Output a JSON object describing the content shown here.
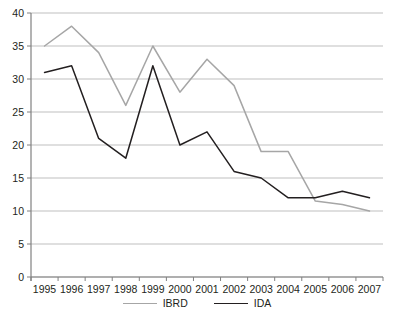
{
  "chart_data": {
    "type": "line",
    "title": "",
    "subtitle": "",
    "xlabel": "",
    "ylabel": "",
    "grid": true,
    "legend_position": "bottom",
    "categories": [
      "1995",
      "1996",
      "1997",
      "1998",
      "1999",
      "2000",
      "2001",
      "2002",
      "2003",
      "2004",
      "2005",
      "2006",
      "2007"
    ],
    "x": [
      1995,
      1996,
      1997,
      1998,
      1999,
      2000,
      2001,
      2002,
      2003,
      2004,
      2005,
      2006,
      2007
    ],
    "ylim": [
      0,
      40
    ],
    "yticks": [
      0,
      5,
      10,
      15,
      20,
      25,
      30,
      35,
      40
    ],
    "series": [
      {
        "name": "IBRD",
        "color": "#a6a6a6",
        "values": [
          35,
          38,
          34,
          26,
          35,
          28,
          33,
          29,
          19,
          19,
          11.5,
          11,
          10
        ]
      },
      {
        "name": "IDA",
        "color": "#231f20",
        "values": [
          31,
          32,
          21,
          18,
          32,
          20,
          22,
          16,
          15,
          12,
          12,
          13,
          12
        ]
      }
    ]
  },
  "axes": {
    "y_tick_labels": [
      "40",
      "35",
      "30",
      "25",
      "20",
      "15",
      "10",
      "5",
      "0"
    ],
    "x_tick_labels": [
      "1995",
      "1996",
      "1997",
      "1998",
      "1999",
      "2000",
      "2001",
      "2002",
      "2003",
      "2004",
      "2005",
      "2006",
      "2007"
    ]
  },
  "legend": {
    "items": [
      {
        "label": "IBRD",
        "color": "#a6a6a6"
      },
      {
        "label": "IDA",
        "color": "#231f20"
      }
    ]
  },
  "colors": {
    "ibrd_line": "#a6a6a6",
    "ida_line": "#231f20",
    "gridline": "#bfbfbf",
    "axis": "#808080",
    "text": "#231f20",
    "background": "#ffffff"
  }
}
